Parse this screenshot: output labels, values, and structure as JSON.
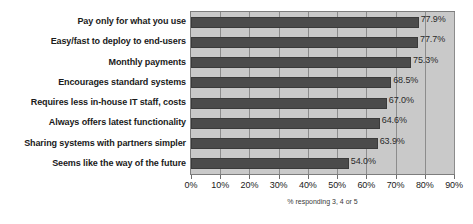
{
  "chart_data": {
    "type": "bar",
    "orientation": "horizontal",
    "title": "",
    "xlabel": "% responding 3, 4 or 5",
    "ylabel": "",
    "xlim": [
      0,
      90
    ],
    "xtick_labels": [
      "0%",
      "10%",
      "20%",
      "30%",
      "40%",
      "50%",
      "60%",
      "70%",
      "80%",
      "90%"
    ],
    "xticks": [
      0,
      10,
      20,
      30,
      40,
      50,
      60,
      70,
      80,
      90
    ],
    "grid": true,
    "legend": false,
    "categories": [
      "Pay only for what you use",
      "Easy/fast to deploy to end-users",
      "Monthly payments",
      "Encourages standard systems",
      "Requires less in-house IT staff, costs",
      "Always offers latest functionality",
      "Sharing systems with partners simpler",
      "Seems like the way of the future"
    ],
    "values": [
      77.9,
      77.7,
      75.3,
      68.5,
      67.0,
      64.6,
      63.9,
      54.0
    ],
    "value_labels": [
      "77.9%",
      "77.7%",
      "75.3%",
      "68.5%",
      "67.0%",
      "64.6%",
      "63.9%",
      "54.0%"
    ],
    "colors": {
      "bar": "#4b4b4b",
      "plot_background": "#c9c9c9",
      "figure_background": "#ffffff",
      "gridline": "#8c8c8c",
      "axis": "#7d7d7d",
      "text": "#1a1a1a"
    }
  }
}
